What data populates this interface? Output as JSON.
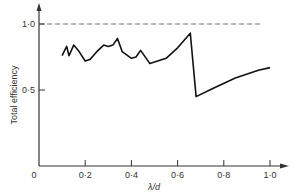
{
  "chart_data": {
    "type": "line",
    "title": "",
    "xlabel": "λ/d",
    "ylabel": "Total efficiency",
    "xlim": [
      0,
      1.05
    ],
    "ylim": [
      0,
      1.1
    ],
    "x_ticks": [
      "0",
      "0·2",
      "0·4",
      "0·6",
      "0·8",
      "1·0"
    ],
    "y_ticks": [
      "0·5",
      "1·0"
    ],
    "grid": false,
    "reference_line": {
      "y": 1.0,
      "style": "dashed"
    },
    "series": [
      {
        "name": "Total efficiency",
        "x": [
          0.1,
          0.12,
          0.13,
          0.15,
          0.17,
          0.2,
          0.22,
          0.25,
          0.28,
          0.3,
          0.32,
          0.34,
          0.36,
          0.4,
          0.42,
          0.44,
          0.48,
          0.55,
          0.6,
          0.64,
          0.655,
          0.68,
          0.75,
          0.85,
          0.95,
          1.0
        ],
        "values": [
          0.76,
          0.83,
          0.76,
          0.84,
          0.8,
          0.72,
          0.73,
          0.79,
          0.84,
          0.83,
          0.84,
          0.89,
          0.79,
          0.74,
          0.75,
          0.8,
          0.7,
          0.74,
          0.82,
          0.9,
          0.93,
          0.45,
          0.51,
          0.59,
          0.65,
          0.67
        ]
      }
    ]
  }
}
